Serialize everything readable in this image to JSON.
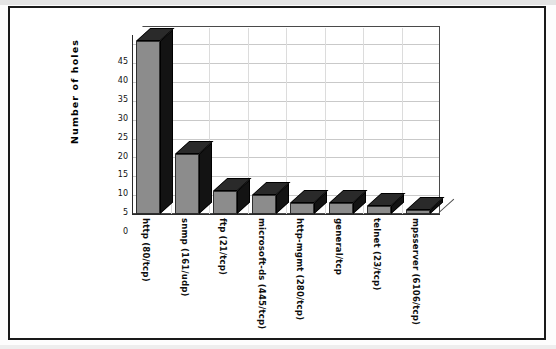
{
  "chart_data": {
    "type": "bar",
    "title": "",
    "subtitle": "",
    "xlabel": "",
    "ylabel": "Number of holes",
    "categories": [
      "http (80/tcp)",
      "snmp (161/udp)",
      "ftp (21/tcp)",
      "microsoft-ds (445/tcp)",
      "http-mgmt (280/tcp)",
      "general/tcp",
      "telnet (23/tcp)",
      "mpsserver (6106/tcp)"
    ],
    "values": [
      46,
      16,
      6,
      5,
      3,
      3,
      2,
      1
    ],
    "ylim": [
      0,
      47.5
    ],
    "yticks": [
      0,
      5,
      10,
      15,
      20,
      25,
      30,
      35,
      40,
      45
    ],
    "ytick_labels": [
      "0",
      "5",
      "10",
      "15",
      "20",
      "25",
      "30",
      "35",
      "40",
      "45"
    ],
    "grid": true,
    "grid_axis": "y",
    "legend": false,
    "legend_position": "none",
    "style": "3d-column",
    "bar_face_color": "#8c8c8c",
    "bar_side_color": "#131313",
    "bar_top_color": "#2a2a2a",
    "axis_color": "#2a2a2a",
    "gridline_color": "#c9c9c9",
    "background_color": "#ffffff",
    "frame_color": "#1a1a1a"
  },
  "figure": {
    "border_label": "chart-frame",
    "plot_area_label": "plot-area"
  }
}
